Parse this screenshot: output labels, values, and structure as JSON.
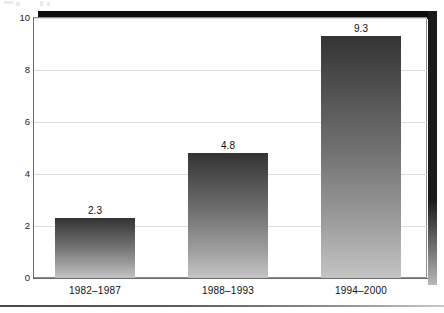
{
  "chart_data": {
    "type": "bar",
    "title": "",
    "subtitle": "",
    "xlabel": "",
    "ylabel": "",
    "categories": [
      "1982–1987",
      "1988–1993",
      "1994–2000"
    ],
    "values": [
      2.3,
      4.8,
      9.3
    ],
    "value_labels": [
      "2.3",
      "4.8",
      "9.3"
    ],
    "ylim": [
      0,
      10
    ],
    "yticks": [
      0,
      2,
      4,
      6,
      8,
      10
    ],
    "ytick_labels": [
      "0",
      "2",
      "4",
      "6",
      "8",
      "10"
    ],
    "grid": "horizontal",
    "legend": "none",
    "bar_fill": "vertical-gradient-dark-to-light",
    "colors": {
      "bar_top": "#343434",
      "bar_bottom": "#c4c4c4",
      "gridline": "#dcdcdc",
      "axis": "#6a6a6a",
      "frame_shadow": "#0d0d0d",
      "text": "#111111",
      "background": "#ffffff"
    }
  },
  "axis": {
    "y_ticks": [
      {
        "label": "10",
        "value": 10
      },
      {
        "label": "8",
        "value": 8
      },
      {
        "label": "6",
        "value": 6
      },
      {
        "label": "4",
        "value": 4
      },
      {
        "label": "2",
        "value": 2
      },
      {
        "label": "0",
        "value": 0
      }
    ]
  },
  "bars": [
    {
      "category": "1982–1987",
      "value": 2.3,
      "label": "2.3"
    },
    {
      "category": "1988–1993",
      "value": 4.8,
      "label": "4.8"
    },
    {
      "category": "1994–2000",
      "value": 9.3,
      "label": "9.3"
    }
  ]
}
